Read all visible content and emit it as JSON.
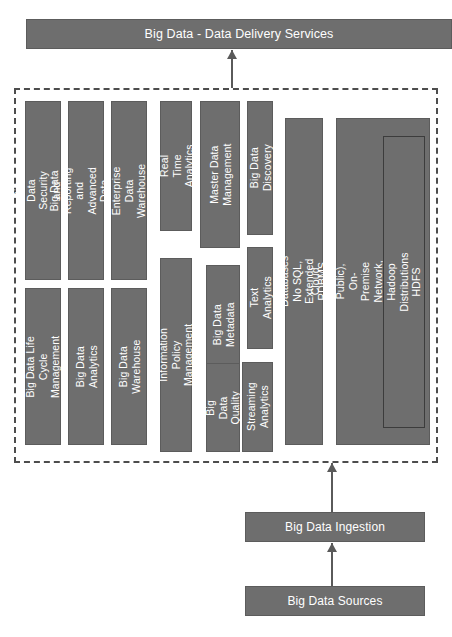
{
  "diagram": {
    "title_banner": {
      "label": "Big Data  - Data Delivery Services"
    },
    "platform_group": {
      "columns": [
        {
          "name": "security-privacy",
          "boxes": [
            {
              "label": "Big Data  Security and\nPrivacy"
            },
            {
              "label": "Big Data Life Cycle\nManagement"
            }
          ]
        },
        {
          "name": "reporting-visualization",
          "boxes": [
            {
              "label": "Big Data Reporting and\nAdvanced Data Visualization"
            },
            {
              "label": "Big Data Analytics"
            }
          ]
        },
        {
          "name": "data-warehouse",
          "boxes": [
            {
              "label": "Enterprise Data Warehouse"
            },
            {
              "label": "Big Data Warehouse"
            }
          ]
        },
        {
          "name": "real-time-policy",
          "boxes": [
            {
              "label": "Real Time Analytics"
            },
            {
              "label": "Information Policy Management"
            }
          ]
        },
        {
          "name": "master-data-metadata",
          "boxes": [
            {
              "label": "Master Data\nManagement"
            },
            {
              "label": "Big Data\nMetadata"
            },
            {
              "label": "Big Data\nQuality"
            }
          ]
        },
        {
          "name": "discovery-text-streaming",
          "boxes": [
            {
              "label": "Big Data Discovery"
            },
            {
              "label": "Text Analytics"
            },
            {
              "label": "Streaming\nAnalytics"
            }
          ]
        }
      ],
      "databases": {
        "label": "Databases\nNo SQL, Extended RDBMS"
      },
      "infrastructure": {
        "label": "Cloud (Private, Public), On-Premise\nNetwork, Compute, Storage",
        "nested": {
          "label": "Hadoop Distributions\nHDFS"
        }
      }
    },
    "ingestion": {
      "label": "Big Data Ingestion"
    },
    "sources": {
      "label": "Big Data Sources"
    },
    "colors": {
      "box_fill": "#6e6e6e",
      "box_border": "#5c5c5c",
      "box_text": "#ffffff",
      "dashed_border": "#4d4d4d",
      "arrow": "#5a5a5a",
      "background": "#ffffff"
    }
  }
}
